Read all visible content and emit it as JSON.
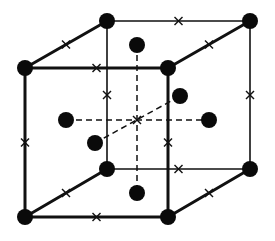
{
  "diagram": {
    "title": "",
    "type": "fcc-unit-cell-with-octahedral-sites",
    "colors": {
      "line": "#111111",
      "atom": "#0a0a0a",
      "background": "#ffffff"
    },
    "atom_radius": 8,
    "corners": {
      "front_top_left": [
        25,
        68
      ],
      "front_top_right": [
        168,
        68
      ],
      "front_bottom_left": [
        25,
        217
      ],
      "front_bottom_right": [
        168,
        217
      ],
      "back_top_left": [
        107,
        21
      ],
      "back_top_right": [
        250,
        21
      ],
      "back_bottom_left": [
        107,
        169
      ],
      "back_bottom_right": [
        250,
        169
      ]
    },
    "face_centers": {
      "top": [
        137,
        45
      ],
      "bottom": [
        137,
        193
      ],
      "left": [
        66,
        120
      ],
      "right": [
        209,
        120
      ],
      "front": [
        95,
        143
      ],
      "back": [
        180,
        96
      ]
    },
    "body_center": [
      137,
      120
    ],
    "octahedral_site_marker": "×",
    "legend": []
  }
}
